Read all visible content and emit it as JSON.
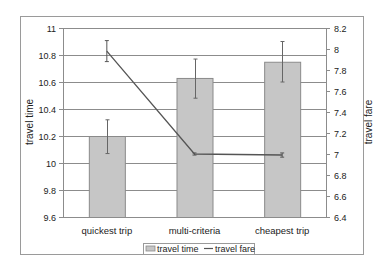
{
  "chart_data": {
    "type": "bar",
    "title": "",
    "categories": [
      "quickest trip",
      "multi-criteria",
      "cheapest trip"
    ],
    "series": [
      {
        "name": "travel time",
        "kind": "bar",
        "axis": "left",
        "values": [
          10.2,
          10.63,
          10.75
        ],
        "error_low": [
          10.07,
          10.48,
          10.6
        ],
        "error_high": [
          10.32,
          10.77,
          10.9
        ]
      },
      {
        "name": "travel fare",
        "kind": "line",
        "axis": "right",
        "values": [
          7.98,
          7.0,
          6.99
        ],
        "error_low": [
          7.88,
          6.99,
          6.97
        ],
        "error_high": [
          8.08,
          7.01,
          7.01
        ]
      }
    ],
    "xlabel": "",
    "ylabel": "travel time",
    "y2label": "travel fare",
    "ylim": [
      9.6,
      11
    ],
    "y2lim": [
      6.4,
      8.2
    ],
    "yticks": [
      "9.6",
      "9.8",
      "10",
      "10.2",
      "10.4",
      "10.6",
      "10.8",
      "11"
    ],
    "y2ticks": [
      "6.4",
      "6.6",
      "6.8",
      "7",
      "7.2",
      "7.4",
      "7.6",
      "7.8",
      "8",
      "8.2"
    ],
    "grid": true,
    "legend_position": "bottom",
    "legend": [
      "travel time",
      "travel fare"
    ]
  },
  "colors": {
    "bar_fill": "#c6c6c6",
    "bar_stroke": "#8a8a8a",
    "line": "#555555",
    "grid": "#8c8c8c",
    "axis": "#8c8c8c",
    "frame": "#9a9a9a"
  }
}
